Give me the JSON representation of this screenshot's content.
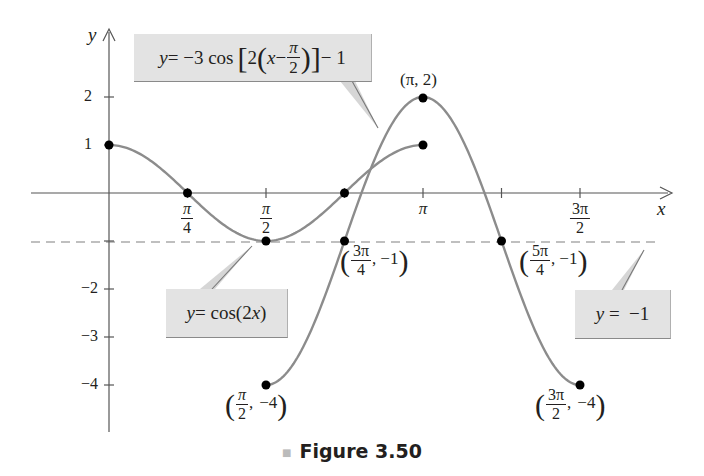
{
  "chart_data": {
    "type": "line",
    "title": "",
    "caption": "Figure 3.50",
    "xlabel": "x",
    "ylabel": "y",
    "xlim_radians": [
      -0.98,
      3.9
    ],
    "ylim": [
      -4.9,
      3.3
    ],
    "x_ticks": [
      {
        "value": 0.7854,
        "num": "π",
        "den": "4"
      },
      {
        "value": 1.5708,
        "num": "π",
        "den": "2"
      },
      {
        "value": 2.3562,
        "num": "",
        "den": ""
      },
      {
        "value": 3.1416,
        "label": "π"
      },
      {
        "value": 3.927,
        "num": "",
        "den": ""
      },
      {
        "value": 4.7124,
        "num": "3π",
        "den": "2"
      }
    ],
    "y_ticks": [
      2,
      1,
      -1,
      -2,
      -3,
      -4
    ],
    "y_tick_labels": [
      "2",
      "1",
      "−2",
      "−3",
      "−4"
    ],
    "grid": false,
    "series": [
      {
        "name": "y = cos(2x)",
        "function": "cos(2x)",
        "domain": [
          0,
          3.1416
        ],
        "color": "#8c8c8c",
        "key_points": [
          [
            0,
            1
          ],
          [
            0.7854,
            0
          ],
          [
            1.5708,
            -1
          ],
          [
            2.3562,
            0
          ],
          [
            3.1416,
            1
          ]
        ]
      },
      {
        "name": "y = −3cos[2(x − π/2)] − 1",
        "function": "-3*cos(2*(x-pi/2))-1",
        "domain": [
          1.5708,
          4.7124
        ],
        "color": "#8c8c8c",
        "key_points": [
          [
            1.5708,
            -4
          ],
          [
            2.3562,
            -1
          ],
          [
            3.1416,
            2
          ],
          [
            3.927,
            -1
          ],
          [
            4.7124,
            -4
          ]
        ]
      },
      {
        "name": "y = −1",
        "function": "-1",
        "style": "dashed",
        "color": "#aaaaaa"
      }
    ],
    "annotations": [
      {
        "text": "(π, 2)",
        "point": [
          3.1416,
          2
        ]
      },
      {
        "text": "(3π/4, −1)",
        "point": [
          2.3562,
          -1
        ]
      },
      {
        "text": "(5π/4, −1)",
        "point": [
          3.927,
          -1
        ]
      },
      {
        "text": "(π/2, −4)",
        "point": [
          1.5708,
          -4
        ]
      },
      {
        "text": "(3π/2, −4)",
        "point": [
          4.7124,
          -4
        ]
      }
    ],
    "callouts": [
      {
        "text": "y = −3cos[2(x − π/2)] − 1",
        "target_series": 1
      },
      {
        "text": "y = cos(2x)",
        "target_series": 0
      },
      {
        "text": "y = −1",
        "target_series": 2
      }
    ]
  },
  "labels": {
    "axis_x": "x",
    "axis_y": "y",
    "caption": "Figure 3.50",
    "y2": "2",
    "y1": "1",
    "yn2": "−2",
    "yn3": "−3",
    "yn4": "−4",
    "pi": "π",
    "pi_num": "π",
    "four": "4",
    "two": "2",
    "three_pi": "3π",
    "five_pi": "5π",
    "neg1": "−1",
    "neg4": "−4",
    "comma": ",",
    "peak": "(π, 2)",
    "callout1": {
      "lhs": "y",
      "eq": " = −3 cos",
      "lb": "[",
      "two": "2",
      "lp": "(",
      "x": "x",
      "minus": " − ",
      "rp": ")",
      "rb": "]",
      "tail": " − 1"
    },
    "callout2": {
      "lhs": "y",
      "eq": " = cos(2",
      "x": "x",
      "tail": ")"
    },
    "callout3": {
      "lhs": "y",
      "eq": " =  −1"
    }
  },
  "colors": {
    "curve": "#8c8c8c",
    "axis": "#555555",
    "dash": "#aaaaaa",
    "dot": "#000000",
    "callout_bg": "#e3e3e3"
  }
}
